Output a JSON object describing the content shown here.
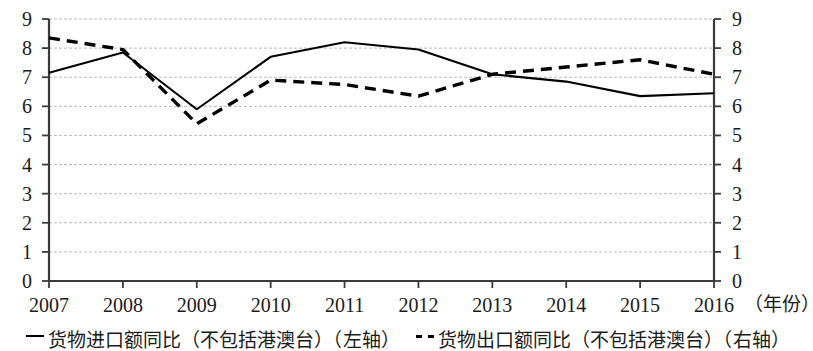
{
  "chart_data": {
    "type": "line",
    "title": "",
    "subtitle": "",
    "xlabel": "（年份）",
    "ylabel": "",
    "categories": [
      "2007",
      "2008",
      "2009",
      "2010",
      "2011",
      "2012",
      "2013",
      "2014",
      "2015",
      "2016"
    ],
    "x": [
      2007,
      2008,
      2009,
      2010,
      2011,
      2012,
      2013,
      2014,
      2015,
      2016
    ],
    "series": [
      {
        "name": "货物进口额同比（不包括港澳台）（左轴）",
        "style": "solid",
        "color": "#000000",
        "axis": "left",
        "values": [
          7.15,
          7.85,
          5.9,
          7.7,
          8.2,
          7.95,
          7.1,
          6.85,
          6.35,
          6.45
        ]
      },
      {
        "name": "货物出口额同比（不包括港澳台）（右轴）",
        "style": "dashed",
        "color": "#000000",
        "axis": "right",
        "values": [
          8.35,
          7.95,
          5.4,
          6.9,
          6.75,
          6.35,
          7.1,
          7.35,
          7.6,
          7.1
        ]
      }
    ],
    "ylim": [
      0,
      9
    ],
    "ylim_right": [
      0,
      9
    ],
    "yticks": [
      0,
      1,
      2,
      3,
      4,
      5,
      6,
      7,
      8,
      9
    ],
    "yticks_right": [
      0,
      1,
      2,
      3,
      4,
      5,
      6,
      7,
      8,
      9
    ],
    "grid": true,
    "grid_axis": "y",
    "legend_position": "bottom"
  },
  "axes": {
    "left_ticks": [
      "9",
      "8",
      "7",
      "6",
      "5",
      "4",
      "3",
      "2",
      "1",
      "0"
    ],
    "right_ticks": [
      "9",
      "8",
      "7",
      "6",
      "5",
      "4",
      "3",
      "2",
      "1",
      "0"
    ],
    "x_ticks": [
      "2007",
      "2008",
      "2009",
      "2010",
      "2011",
      "2012",
      "2013",
      "2014",
      "2015",
      "2016"
    ],
    "x_axis_title": "（年份）"
  },
  "legend": {
    "items": [
      {
        "label": "货物进口额同比（不包括港澳台）（左轴）",
        "style": "solid"
      },
      {
        "label": "货物出口额同比（不包括港澳台）（右轴）",
        "style": "dashed"
      }
    ]
  },
  "colors": {
    "ink": "#000000",
    "grid": "#b9b9b9",
    "axis": "#3a3a3a",
    "background": "#ffffff"
  }
}
